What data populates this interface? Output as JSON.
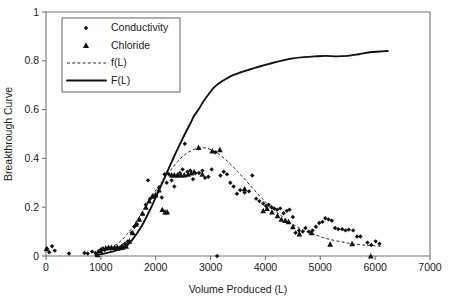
{
  "chart_data": {
    "type": "scatter",
    "title": "",
    "xlabel": "Volume Produced (L)",
    "ylabel": "Breakthrough Curve",
    "xlim": [
      0,
      7000
    ],
    "ylim": [
      0,
      1
    ],
    "xticks": [
      0,
      1000,
      2000,
      3000,
      4000,
      5000,
      6000,
      7000
    ],
    "yticks": [
      0,
      0.2,
      0.4,
      0.6,
      0.8,
      1
    ],
    "xtick_labels": [
      "0",
      "1000",
      "2000",
      "3000",
      "4000",
      "5000",
      "6000",
      "7000"
    ],
    "ytick_labels": [
      "0",
      "0.2",
      "0.4",
      "0.6",
      "0.8",
      "1"
    ],
    "grid": false,
    "legend_position": "upper-left",
    "legend": [
      {
        "label": "Conductivity",
        "marker": "diamond",
        "style": "marker"
      },
      {
        "label": "Chloride",
        "marker": "triangle",
        "style": "marker"
      },
      {
        "label": "f(L)",
        "marker": "none",
        "style": "dashed-line"
      },
      {
        "label": "F(L)",
        "marker": "none",
        "style": "solid-line"
      }
    ],
    "series": [
      {
        "name": "Conductivity",
        "marker": "diamond",
        "points": [
          [
            20,
            0.03
          ],
          [
            60,
            0.015
          ],
          [
            110,
            0.04
          ],
          [
            160,
            0.022
          ],
          [
            420,
            0.01
          ],
          [
            700,
            0.012
          ],
          [
            760,
            0.01
          ],
          [
            840,
            0.018
          ],
          [
            900,
            0.013
          ],
          [
            960,
            0.02
          ],
          [
            1010,
            0.028
          ],
          [
            1070,
            0.025
          ],
          [
            1130,
            0.032
          ],
          [
            1180,
            0.03
          ],
          [
            1240,
            0.032
          ],
          [
            1300,
            0.035
          ],
          [
            1340,
            0.03
          ],
          [
            1390,
            0.042
          ],
          [
            1440,
            0.05
          ],
          [
            1490,
            0.06
          ],
          [
            1560,
            0.095
          ],
          [
            1610,
            0.12
          ],
          [
            1660,
            0.13
          ],
          [
            1700,
            0.15
          ],
          [
            1760,
            0.172
          ],
          [
            1820,
            0.21
          ],
          [
            1860,
            0.31
          ],
          [
            1900,
            0.235
          ],
          [
            1950,
            0.245
          ],
          [
            2000,
            0.25
          ],
          [
            2060,
            0.28
          ],
          [
            2110,
            0.24
          ],
          [
            2160,
            0.335
          ],
          [
            2200,
            0.3
          ],
          [
            2240,
            0.335
          ],
          [
            2290,
            0.31
          ],
          [
            2340,
            0.285
          ],
          [
            2390,
            0.33
          ],
          [
            2440,
            0.34
          ],
          [
            2490,
            0.355
          ],
          [
            2530,
            0.46
          ],
          [
            2580,
            0.345
          ],
          [
            2630,
            0.35
          ],
          [
            2680,
            0.315
          ],
          [
            2720,
            0.34
          ],
          [
            2790,
            0.34
          ],
          [
            2850,
            0.35
          ],
          [
            2900,
            0.32
          ],
          [
            2960,
            0.325
          ],
          [
            3020,
            0.355
          ],
          [
            3090,
            0.425
          ],
          [
            3120,
            0.0
          ],
          [
            3180,
            0.33
          ],
          [
            3240,
            0.345
          ],
          [
            3300,
            0.335
          ],
          [
            3360,
            0.3
          ],
          [
            3420,
            0.285
          ],
          [
            3480,
            0.255
          ],
          [
            3540,
            0.27
          ],
          [
            3620,
            0.26
          ],
          [
            3700,
            0.265
          ],
          [
            3760,
            0.33
          ],
          [
            3830,
            0.235
          ],
          [
            3890,
            0.225
          ],
          [
            3960,
            0.215
          ],
          [
            4010,
            0.205
          ],
          [
            4060,
            0.21
          ],
          [
            4110,
            0.2
          ],
          [
            4160,
            0.195
          ],
          [
            4210,
            0.19
          ],
          [
            4270,
            0.195
          ],
          [
            4330,
            0.175
          ],
          [
            4390,
            0.185
          ],
          [
            4440,
            0.19
          ],
          [
            4500,
            0.16
          ],
          [
            4550,
            0.095
          ],
          [
            4610,
            0.105
          ],
          [
            4680,
            0.1
          ],
          [
            4730,
            0.115
          ],
          [
            4790,
            0.1
          ],
          [
            4860,
            0.105
          ],
          [
            4920,
            0.12
          ],
          [
            4980,
            0.135
          ],
          [
            5040,
            0.14
          ],
          [
            5090,
            0.155
          ],
          [
            5150,
            0.15
          ],
          [
            5210,
            0.145
          ],
          [
            5270,
            0.115
          ],
          [
            5330,
            0.11
          ],
          [
            5400,
            0.11
          ],
          [
            5460,
            0.105
          ],
          [
            5520,
            0.108
          ],
          [
            5600,
            0.105
          ],
          [
            5670,
            0.08
          ],
          [
            5730,
            0.08
          ],
          [
            5860,
            0.055
          ],
          [
            5930,
            0.045
          ],
          [
            6010,
            0.06
          ],
          [
            6080,
            0.05
          ]
        ]
      },
      {
        "name": "Chloride",
        "marker": "triangle",
        "points": [
          [
            10,
            0.03
          ],
          [
            940,
            0.005
          ],
          [
            990,
            0.022
          ],
          [
            1040,
            0.03
          ],
          [
            1090,
            0.033
          ],
          [
            1140,
            0.035
          ],
          [
            1190,
            0.035
          ],
          [
            1250,
            0.035
          ],
          [
            1300,
            0.036
          ],
          [
            1350,
            0.034
          ],
          [
            1400,
            0.036
          ],
          [
            1460,
            0.04
          ],
          [
            1520,
            0.06
          ],
          [
            1580,
            0.095
          ],
          [
            1640,
            0.13
          ],
          [
            1700,
            0.15
          ],
          [
            1760,
            0.175
          ],
          [
            1820,
            0.2
          ],
          [
            1880,
            0.225
          ],
          [
            1940,
            0.245
          ],
          [
            2000,
            0.25
          ],
          [
            2060,
            0.27
          ],
          [
            2120,
            0.19
          ],
          [
            2170,
            0.18
          ],
          [
            2210,
            0.18
          ],
          [
            2290,
            0.332
          ],
          [
            2340,
            0.332
          ],
          [
            2400,
            0.332
          ],
          [
            2460,
            0.332
          ],
          [
            2520,
            0.332
          ],
          [
            2590,
            0.335
          ],
          [
            2650,
            0.34
          ],
          [
            2700,
            0.345
          ],
          [
            2780,
            0.445
          ],
          [
            2850,
            0.335
          ],
          [
            3030,
            0.43
          ],
          [
            3170,
            0.435
          ],
          [
            3620,
            0.275
          ],
          [
            3960,
            0.185
          ],
          [
            4030,
            0.195
          ],
          [
            4120,
            0.18
          ],
          [
            4220,
            0.165
          ],
          [
            4290,
            0.15
          ],
          [
            4360,
            0.145
          ],
          [
            4420,
            0.14
          ],
          [
            4500,
            0.12
          ],
          [
            4620,
            0.09
          ],
          [
            4840,
            0.095
          ],
          [
            5180,
            0.048
          ],
          [
            5580,
            0.05
          ],
          [
            5920,
            0.0
          ]
        ]
      }
    ],
    "curves": [
      {
        "name": "f(L)",
        "style": "dashed",
        "points": [
          [
            900,
            0.012
          ],
          [
            1100,
            0.03
          ],
          [
            1300,
            0.05
          ],
          [
            1500,
            0.095
          ],
          [
            1700,
            0.16
          ],
          [
            1900,
            0.235
          ],
          [
            2100,
            0.3
          ],
          [
            2300,
            0.36
          ],
          [
            2500,
            0.41
          ],
          [
            2700,
            0.437
          ],
          [
            2900,
            0.443
          ],
          [
            3100,
            0.425
          ],
          [
            3300,
            0.39
          ],
          [
            3500,
            0.345
          ],
          [
            3700,
            0.295
          ],
          [
            3900,
            0.245
          ],
          [
            4100,
            0.2
          ],
          [
            4300,
            0.163
          ],
          [
            4500,
            0.13
          ],
          [
            4700,
            0.105
          ],
          [
            4900,
            0.088
          ],
          [
            5100,
            0.072
          ],
          [
            5300,
            0.062
          ],
          [
            5500,
            0.053
          ],
          [
            5700,
            0.047
          ],
          [
            5900,
            0.043
          ],
          [
            6100,
            0.04
          ]
        ]
      },
      {
        "name": "F(L)",
        "style": "solid",
        "points": [
          [
            900,
            0.004
          ],
          [
            1100,
            0.012
          ],
          [
            1300,
            0.024
          ],
          [
            1450,
            0.038
          ],
          [
            1550,
            0.06
          ],
          [
            1650,
            0.09
          ],
          [
            1750,
            0.125
          ],
          [
            1850,
            0.168
          ],
          [
            1950,
            0.215
          ],
          [
            2050,
            0.265
          ],
          [
            2150,
            0.315
          ],
          [
            2250,
            0.365
          ],
          [
            2350,
            0.415
          ],
          [
            2450,
            0.462
          ],
          [
            2550,
            0.508
          ],
          [
            2650,
            0.552
          ],
          [
            2700,
            0.575
          ],
          [
            2780,
            0.6
          ],
          [
            2860,
            0.63
          ],
          [
            2960,
            0.662
          ],
          [
            3060,
            0.69
          ],
          [
            3180,
            0.712
          ],
          [
            3300,
            0.728
          ],
          [
            3420,
            0.742
          ],
          [
            3540,
            0.752
          ],
          [
            3680,
            0.762
          ],
          [
            3820,
            0.772
          ],
          [
            3980,
            0.782
          ],
          [
            4140,
            0.792
          ],
          [
            4320,
            0.802
          ],
          [
            4500,
            0.81
          ],
          [
            4700,
            0.815
          ],
          [
            4900,
            0.818
          ],
          [
            5100,
            0.82
          ],
          [
            5300,
            0.818
          ],
          [
            5500,
            0.82
          ],
          [
            5700,
            0.827
          ],
          [
            5900,
            0.835
          ],
          [
            6080,
            0.838
          ],
          [
            6230,
            0.84
          ]
        ]
      }
    ]
  }
}
